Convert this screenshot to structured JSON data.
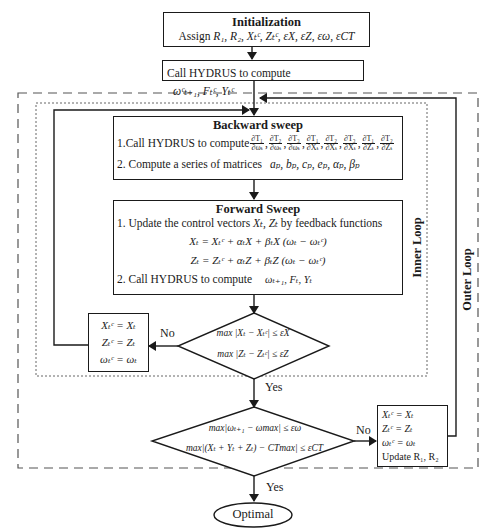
{
  "initialization": {
    "title": "Initialization",
    "assign_label": "Assign",
    "assign_items": "R₁, R₂,  Xₜᶜ, Zₜᶜ, εX, εZ, εω, εCT"
  },
  "call_hydrus_initial": {
    "text": "Call HYDRUS to compute",
    "outputs": "ωᶜₜ₊₁, Fₜᶜ, Yₜᶜ"
  },
  "backward_sweep": {
    "title": "Backward sweep",
    "step1": "1.Call HYDRUS to compute",
    "derivatives": [
      {
        "n": "∂T₁",
        "d": "∂ωₜ"
      },
      {
        "n": "∂T₂",
        "d": "∂ωₜ"
      },
      {
        "n": "∂T₃",
        "d": "∂ωₜ"
      },
      {
        "n": "∂T₁",
        "d": "∂Xₜ"
      },
      {
        "n": "∂T₂",
        "d": "∂Xₜ"
      },
      {
        "n": "∂T₃",
        "d": "∂Xₜ"
      },
      {
        "n": "∂T₁",
        "d": "∂Zₜ"
      },
      {
        "n": "∂T₂",
        "d": "∂Zₜ"
      }
    ],
    "step2": "2. Compute a series of matrices",
    "matrices": "aₚ, bₚ, cₚ, eₚ, αₚ, βₚ"
  },
  "forward_sweep": {
    "title": "Forward Sweep",
    "step1_prefix": "1. Update the control vectors",
    "step1_vars": "Xₜ, Zₜ",
    "step1_suffix": "by feedback functions",
    "eq1": "Xₜ = Xₜᶜ + αₜX + βₜX (ωₜ − ωₜᶜ)",
    "eq2": "Zₜ = Zₜᶜ + αₜZ + βₜZ (ωₜ − ωₜᶜ)",
    "step2": "2. Call HYDRUS to compute",
    "step2_outputs": "ωₜ₊₁,  Fₜ,  Yₜ"
  },
  "inner_decision": {
    "cond1": "max |Xₜ − Xₜᶜ| ≤ εX",
    "cond2": "max |Zₜ − Zₜᶜ| ≤ εZ",
    "sub": "t",
    "no_label": "No",
    "yes_label": "Yes"
  },
  "inner_update": {
    "lines": [
      "Xₜᶜ = Xₜ",
      "Zₜᶜ = Zₜ",
      "ωₜᶜ = ωₜ"
    ]
  },
  "outer_decision": {
    "cond1": "max|ωₜ₊₁ − ωmax| ≤ εω",
    "cond2": "max|(Xₜ + Yₜ + Zₜ) − CTmax| ≤ εCT",
    "sub": "t",
    "no_label": "No",
    "yes_label": "Yes"
  },
  "outer_update": {
    "lines": [
      "Xₜᶜ = Xₜ",
      "Zₜᶜ = Zₜ",
      "ωₜᶜ = ωₜ",
      "Update R₁, R₂"
    ]
  },
  "loops": {
    "inner": "Inner Loop",
    "outer": "Outer Loop"
  },
  "terminal": {
    "label": "Optimal"
  }
}
